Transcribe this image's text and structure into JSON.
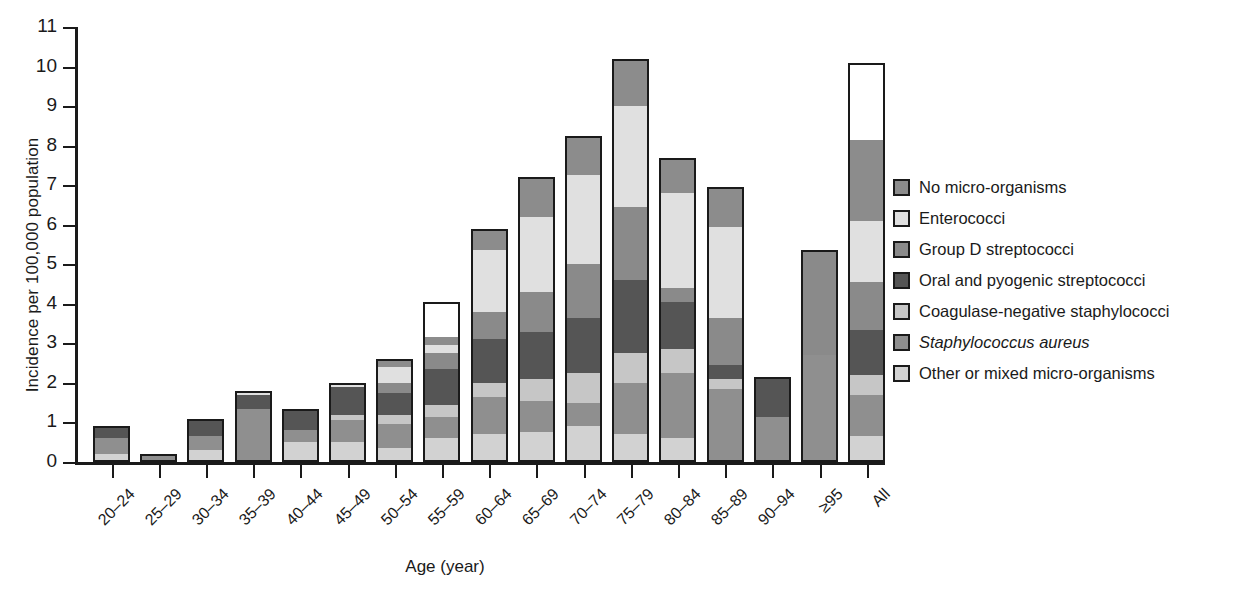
{
  "chart_data": {
    "type": "bar",
    "subtype": "stacked-bar",
    "title": "",
    "xlabel": "Age (year)",
    "ylabel": "Incidence per 100,000 population",
    "ylim": [
      0,
      11
    ],
    "yticks": [
      0,
      1,
      2,
      3,
      4,
      5,
      6,
      7,
      8,
      9,
      10,
      11
    ],
    "grid": false,
    "legend_position": "right",
    "categories": [
      "20–24",
      "25–29",
      "30–34",
      "35–39",
      "40–44",
      "45–49",
      "50–54",
      "55–59",
      "60–64",
      "65–69",
      "70–74",
      "75–79",
      "80–84",
      "85–89",
      "90–94",
      "≥95",
      "All"
    ],
    "series": [
      {
        "name": "Other or mixed micro-organisms",
        "color": "#d2d2d2",
        "values": [
          0.15,
          0.0,
          0.25,
          0.0,
          0.45,
          0.45,
          0.3,
          0.55,
          0.65,
          0.7,
          0.85,
          0.65,
          0.55,
          0.0,
          0.0,
          0.0,
          0.6
        ]
      },
      {
        "name": "Staphylococcus aureus",
        "color": "#8f8f8f",
        "values": [
          0.4,
          0.1,
          0.35,
          1.3,
          0.3,
          0.55,
          0.6,
          0.55,
          0.95,
          0.8,
          0.6,
          1.3,
          1.65,
          1.8,
          1.1,
          2.65,
          1.05
        ]
      },
      {
        "name": "Coagulase-negative staphylococci",
        "color": "#c6c6c6",
        "values": [
          0.0,
          0.0,
          0.0,
          0.0,
          0.0,
          0.15,
          0.25,
          0.3,
          0.35,
          0.55,
          0.75,
          0.75,
          0.6,
          0.25,
          0.0,
          0.0,
          0.5
        ]
      },
      {
        "name": "Oral and pyogenic streptococci",
        "color": "#555555",
        "values": [
          0.35,
          0.1,
          0.5,
          0.35,
          0.6,
          0.7,
          0.55,
          0.9,
          1.1,
          1.2,
          1.4,
          1.85,
          1.2,
          0.35,
          1.05,
          0.0,
          1.15
        ]
      },
      {
        "name": "Group D streptococci",
        "color": "#8a8a8a",
        "values": [
          0.0,
          0.0,
          0.0,
          0.0,
          0.0,
          0.0,
          0.25,
          0.4,
          0.7,
          1.0,
          1.35,
          1.85,
          0.35,
          1.2,
          0.0,
          2.7,
          1.2
        ]
      },
      {
        "name": "Enterococci",
        "color": "#e0e0e0",
        "values": [
          0.0,
          0.0,
          0.0,
          0.15,
          0.0,
          0.15,
          0.4,
          0.2,
          1.55,
          1.9,
          2.25,
          2.55,
          2.4,
          2.3,
          0.0,
          0.0,
          1.55
        ]
      },
      {
        "name": "No micro-organisms",
        "color": "#8c8c8c",
        "values": [
          0.0,
          0.0,
          0.0,
          0.0,
          0.0,
          0.0,
          0.25,
          0.2,
          0.5,
          1.05,
          1.05,
          1.35,
          0.95,
          1.05,
          0.0,
          0.0,
          2.05
        ]
      }
    ],
    "totals": [
      0.9,
      0.2,
      1.1,
      1.8,
      1.35,
      2.0,
      2.6,
      4.05,
      5.9,
      7.2,
      8.25,
      10.2,
      7.7,
      6.95,
      2.15,
      5.35,
      10.1
    ]
  },
  "axes": {
    "y_title": "Incidence per 100,000 population",
    "x_title": "Age (year)",
    "y_tick_labels": [
      "0",
      "1",
      "2",
      "3",
      "4",
      "5",
      "6",
      "7",
      "8",
      "9",
      "10",
      "11"
    ],
    "x_tick_labels": [
      "20–24",
      "25–29",
      "30–34",
      "35–39",
      "40–44",
      "45–49",
      "50–54",
      "55–59",
      "60–64",
      "65–69",
      "70–74",
      "75–79",
      "80–84",
      "85–89",
      "90–94",
      "≥95",
      "All"
    ]
  },
  "legend": {
    "items": [
      {
        "label": "No micro-organisms",
        "color": "#8c8c8c",
        "italic": false
      },
      {
        "label": "Enterococci",
        "color": "#e0e0e0",
        "italic": false
      },
      {
        "label": "Group D streptococci",
        "color": "#8a8a8a",
        "italic": false
      },
      {
        "label": "Oral and pyogenic streptococci",
        "color": "#555555",
        "italic": false
      },
      {
        "label": "Coagulase-negative staphylococci",
        "color": "#c6c6c6",
        "italic": false
      },
      {
        "label": "Staphylococcus aureus",
        "color": "#8f8f8f",
        "italic": true
      },
      {
        "label": "Other or mixed micro-organisms",
        "color": "#d2d2d2",
        "italic": false
      }
    ]
  },
  "style": {
    "axis_color": "#1a1a1a",
    "background": "#ffffff",
    "bar_outline": "#1a1a1a"
  }
}
